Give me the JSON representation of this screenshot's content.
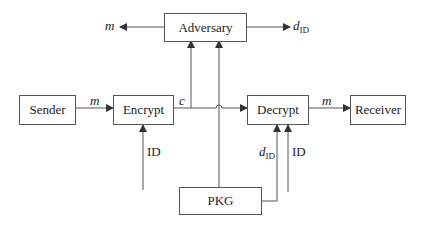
{
  "nodes": {
    "adversary": {
      "label": "Adversary"
    },
    "sender": {
      "label": "Sender"
    },
    "encrypt": {
      "label": "Encrypt"
    },
    "decrypt": {
      "label": "Decrypt"
    },
    "receiver": {
      "label": "Receiver"
    },
    "pkg": {
      "label": "PKG"
    }
  },
  "edges": {
    "adversary_m_out": {
      "label": "m"
    },
    "adversary_did_out": {
      "label": "d",
      "sub": "ID"
    },
    "sender_to_encrypt": {
      "label": "m"
    },
    "encrypt_out_c": {
      "label": "c"
    },
    "decrypt_to_receiver": {
      "label": "m"
    },
    "id_to_encrypt": {
      "label": "ID"
    },
    "pkg_to_decrypt": {
      "label": "d",
      "sub": "ID"
    },
    "id_to_decrypt": {
      "label": "ID"
    }
  },
  "colors": {
    "line": "#555555",
    "text": "#222222"
  }
}
